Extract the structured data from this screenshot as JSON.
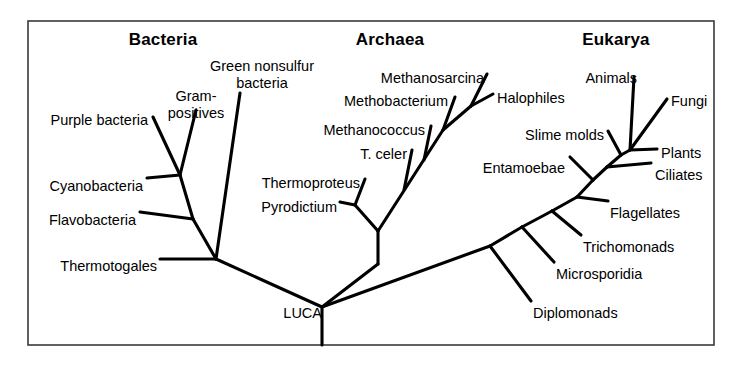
{
  "figure": {
    "kind": "phylogenetic-tree",
    "frame_color": "#3a3a3a",
    "branch_color": "#000000",
    "background_color": "#ffffff"
  },
  "domains": [
    {
      "id": "bacteria",
      "label": "Bacteria",
      "x": 163,
      "y": 30
    },
    {
      "id": "archaea",
      "label": "Archaea",
      "x": 390,
      "y": 30
    },
    {
      "id": "eukarya",
      "label": "Eukarya",
      "x": 616,
      "y": 30
    }
  ],
  "root": {
    "label": "LUCA",
    "x": 322,
    "y": 305
  },
  "taxa": [
    {
      "id": "purple-bacteria",
      "label": "Purple bacteria",
      "domain": "bacteria",
      "x": 148,
      "y": 112,
      "align": "end"
    },
    {
      "id": "gram-positives",
      "label": "Gram-\npositives",
      "domain": "bacteria",
      "x": 196,
      "y": 88,
      "align": "mid"
    },
    {
      "id": "green-nonsulfur",
      "label": "Green nonsulfur\nbacteria",
      "domain": "bacteria",
      "x": 262,
      "y": 58,
      "align": "mid"
    },
    {
      "id": "cyanobacteria",
      "label": "Cyanobacteria",
      "domain": "bacteria",
      "x": 143,
      "y": 178,
      "align": "end"
    },
    {
      "id": "flavobacteria",
      "label": "Flavobacteria",
      "domain": "bacteria",
      "x": 136,
      "y": 212,
      "align": "end"
    },
    {
      "id": "thermotogales",
      "label": "Thermotogales",
      "domain": "bacteria",
      "x": 157,
      "y": 258,
      "align": "end"
    },
    {
      "id": "methanosarcina",
      "label": "Methanosarcina",
      "domain": "archaea",
      "x": 484,
      "y": 70,
      "align": "end"
    },
    {
      "id": "methobacterium",
      "label": "Methobacterium",
      "domain": "archaea",
      "x": 448,
      "y": 93,
      "align": "end"
    },
    {
      "id": "halophiles",
      "label": "Halophiles",
      "domain": "archaea",
      "x": 497,
      "y": 90,
      "align": "start"
    },
    {
      "id": "methanococcus",
      "label": "Methanococcus",
      "domain": "archaea",
      "x": 425,
      "y": 122,
      "align": "end"
    },
    {
      "id": "t-celer",
      "label": "T. celer",
      "domain": "archaea",
      "x": 407,
      "y": 146,
      "align": "end"
    },
    {
      "id": "thermoproteus",
      "label": "Thermoproteus",
      "domain": "archaea",
      "x": 360,
      "y": 175,
      "align": "end"
    },
    {
      "id": "pyrodictium",
      "label": "Pyrodictium",
      "domain": "archaea",
      "x": 337,
      "y": 199,
      "align": "end"
    },
    {
      "id": "animals",
      "label": "Animals",
      "domain": "eukarya",
      "x": 637,
      "y": 70,
      "align": "end"
    },
    {
      "id": "fungi",
      "label": "Fungi",
      "domain": "eukarya",
      "x": 671,
      "y": 93,
      "align": "start"
    },
    {
      "id": "slime-molds",
      "label": "Slime molds",
      "domain": "eukarya",
      "x": 604,
      "y": 127,
      "align": "end"
    },
    {
      "id": "plants",
      "label": "Plants",
      "domain": "eukarya",
      "x": 661,
      "y": 145,
      "align": "start"
    },
    {
      "id": "entamoebae",
      "label": "Entamoebae",
      "domain": "eukarya",
      "x": 565,
      "y": 160,
      "align": "end"
    },
    {
      "id": "ciliates",
      "label": "Ciliates",
      "domain": "eukarya",
      "x": 655,
      "y": 167,
      "align": "start"
    },
    {
      "id": "flagellates",
      "label": "Flagellates",
      "domain": "eukarya",
      "x": 610,
      "y": 205,
      "align": "start"
    },
    {
      "id": "trichomonads",
      "label": "Trichomonads",
      "domain": "eukarya",
      "x": 583,
      "y": 239,
      "align": "start"
    },
    {
      "id": "microsporidia",
      "label": "Microsporidia",
      "domain": "eukarya",
      "x": 556,
      "y": 266,
      "align": "start"
    },
    {
      "id": "diplomonads",
      "label": "Diplomonads",
      "domain": "eukarya",
      "x": 533,
      "y": 305,
      "align": "start"
    }
  ],
  "frame": {
    "x": 28,
    "y": 21,
    "width": 686,
    "height": 324
  },
  "branches": [
    {
      "id": "root-stem",
      "from": [
        322,
        307
      ],
      "to": [
        322,
        345
      ]
    },
    {
      "id": "root-to-bacteria",
      "from": [
        322,
        307
      ],
      "to": [
        216,
        259
      ]
    },
    {
      "id": "root-to-archaea",
      "from": [
        322,
        307
      ],
      "to": [
        378,
        264
      ]
    },
    {
      "id": "archaea-stem",
      "from": [
        378,
        264
      ],
      "to": [
        378,
        231
      ]
    },
    {
      "id": "root-to-eukarya",
      "from": [
        322,
        307
      ],
      "to": [
        490,
        246
      ]
    },
    {
      "id": "bac-thermotogales",
      "from": [
        216,
        259
      ],
      "to": [
        160,
        259
      ]
    },
    {
      "id": "bac-spine",
      "from": [
        216,
        259
      ],
      "to": [
        193,
        219
      ]
    },
    {
      "id": "bac-greennonsulfur",
      "from": [
        216,
        259
      ],
      "to": [
        240,
        93
      ]
    },
    {
      "id": "bac-flavobacteria",
      "from": [
        193,
        219
      ],
      "to": [
        140,
        212
      ]
    },
    {
      "id": "bac-upper",
      "from": [
        193,
        219
      ],
      "to": [
        180,
        175
      ]
    },
    {
      "id": "bac-cyanobacteria",
      "from": [
        180,
        175
      ],
      "to": [
        147,
        178
      ]
    },
    {
      "id": "bac-purple",
      "from": [
        180,
        175
      ],
      "to": [
        153,
        117
      ]
    },
    {
      "id": "bac-grampositive",
      "from": [
        180,
        175
      ],
      "to": [
        196,
        110
      ]
    },
    {
      "id": "arch-crenarch-node",
      "from": [
        378,
        231
      ],
      "to": [
        355,
        205
      ]
    },
    {
      "id": "arch-pyrodictium",
      "from": [
        355,
        205
      ],
      "to": [
        340,
        202
      ]
    },
    {
      "id": "arch-thermoproteus",
      "from": [
        355,
        205
      ],
      "to": [
        365,
        179
      ]
    },
    {
      "id": "arch-euryarch-spine",
      "from": [
        378,
        231
      ],
      "to": [
        443,
        130
      ]
    },
    {
      "id": "arch-tceler",
      "from": [
        404,
        190
      ],
      "to": [
        412,
        150
      ]
    },
    {
      "id": "arch-methanococcus",
      "from": [
        424,
        160
      ],
      "to": [
        431,
        126
      ]
    },
    {
      "id": "arch-methobacterium",
      "from": [
        443,
        130
      ],
      "to": [
        455,
        97
      ]
    },
    {
      "id": "arch-upper-node",
      "from": [
        443,
        130
      ],
      "to": [
        471,
        106
      ]
    },
    {
      "id": "arch-methanosarcina",
      "from": [
        471,
        106
      ],
      "to": [
        487,
        74
      ]
    },
    {
      "id": "arch-halophiles",
      "from": [
        471,
        106
      ],
      "to": [
        493,
        94
      ]
    },
    {
      "id": "euk-diplomonads",
      "from": [
        490,
        246
      ],
      "to": [
        531,
        301
      ]
    },
    {
      "id": "euk-spine-1",
      "from": [
        490,
        246
      ],
      "to": [
        522,
        227
      ]
    },
    {
      "id": "euk-microsporidia",
      "from": [
        522,
        227
      ],
      "to": [
        554,
        262
      ]
    },
    {
      "id": "euk-spine-2",
      "from": [
        522,
        227
      ],
      "to": [
        552,
        211
      ]
    },
    {
      "id": "euk-trichomonads",
      "from": [
        552,
        211
      ],
      "to": [
        581,
        235
      ]
    },
    {
      "id": "euk-spine-3",
      "from": [
        552,
        211
      ],
      "to": [
        577,
        197
      ]
    },
    {
      "id": "euk-flagellates",
      "from": [
        577,
        197
      ],
      "to": [
        608,
        201
      ]
    },
    {
      "id": "euk-spine-4",
      "from": [
        577,
        197
      ],
      "to": [
        593,
        180
      ]
    },
    {
      "id": "euk-entamoebae",
      "from": [
        593,
        180
      ],
      "to": [
        570,
        157
      ]
    },
    {
      "id": "euk-spine-5",
      "from": [
        593,
        180
      ],
      "to": [
        607,
        167
      ]
    },
    {
      "id": "euk-ciliates",
      "from": [
        607,
        167
      ],
      "to": [
        651,
        163
      ]
    },
    {
      "id": "euk-spine-6",
      "from": [
        607,
        167
      ],
      "to": [
        621,
        155
      ]
    },
    {
      "id": "euk-slime-molds",
      "from": [
        621,
        155
      ],
      "to": [
        608,
        131
      ]
    },
    {
      "id": "euk-crown-link",
      "from": [
        621,
        155
      ],
      "to": [
        630,
        150
      ]
    },
    {
      "id": "euk-plants",
      "from": [
        630,
        150
      ],
      "to": [
        657,
        149
      ]
    },
    {
      "id": "euk-animals",
      "from": [
        630,
        150
      ],
      "to": [
        634,
        77
      ]
    },
    {
      "id": "euk-fungi",
      "from": [
        630,
        150
      ],
      "to": [
        667,
        99
      ]
    }
  ]
}
